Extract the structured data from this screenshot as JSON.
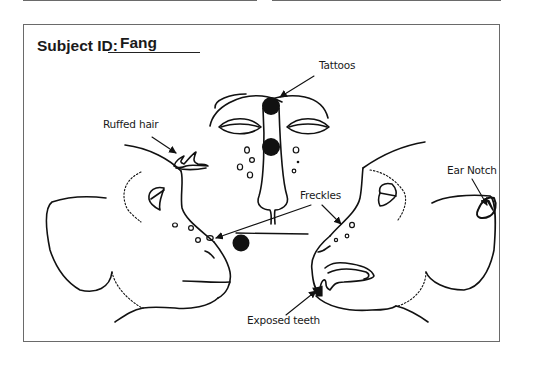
{
  "form": {
    "subject_id_label": "Subject ID:",
    "subject_id_value": "Fang"
  },
  "annotations": {
    "tattoos": "Tattoos",
    "ruffed_hair": "Ruffed hair",
    "freckles": "Freckles",
    "ear_notch": "Ear Notch",
    "exposed_teeth": "Exposed teeth"
  },
  "figures": {
    "views": [
      "left-profile",
      "front-face",
      "right-profile"
    ],
    "line_color": "#111111",
    "frame_color": "#6a6a6a"
  }
}
